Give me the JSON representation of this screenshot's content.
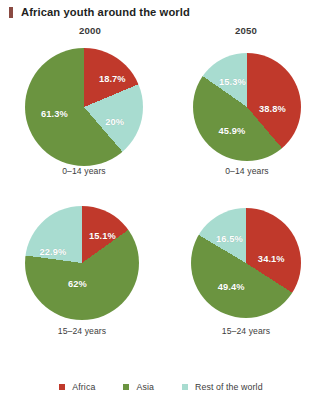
{
  "title": "African youth around the world",
  "title_marker_color": "#8a4a42",
  "columns": [
    {
      "year": "2000"
    },
    {
      "year": "2050"
    }
  ],
  "legend": {
    "position": "bottom-center",
    "items": [
      {
        "label": "Africa",
        "color": "#c0392b"
      },
      {
        "label": "Asia",
        "color": "#6b9440"
      },
      {
        "label": "Rest of the world",
        "color": "#a8dcd0"
      }
    ]
  },
  "chart_data": {
    "type": "pie",
    "title": "African youth around the world",
    "xlabel": "",
    "ylabel": "",
    "units": "percent",
    "legend": [
      "Africa",
      "Asia",
      "Rest of the world"
    ],
    "colors": {
      "Africa": "#c0392b",
      "Asia": "#6b9440",
      "Rest of the world": "#a8dcd0"
    },
    "panels": [
      {
        "year": "2000",
        "age_group": "0-14 years",
        "sub_label": "0–14 years",
        "categories": [
          "Africa",
          "Rest of the world",
          "Asia"
        ],
        "values": [
          18.7,
          20.0,
          61.3
        ],
        "labels": [
          "18.7%",
          "20%",
          "61.3%"
        ],
        "label_positions": [
          [
            0.48,
            -0.48
          ],
          [
            0.52,
            0.26
          ],
          [
            -0.5,
            0.12
          ]
        ]
      },
      {
        "year": "2050",
        "age_group": "0-14 years",
        "sub_label": "0–14 years",
        "categories": [
          "Africa",
          "Asia",
          "Rest of the world"
        ],
        "values": [
          38.8,
          45.9,
          15.3
        ],
        "labels": [
          "38.8%",
          "45.9%",
          "15.3%"
        ],
        "label_positions": [
          [
            0.47,
            0.04
          ],
          [
            -0.28,
            0.44
          ],
          [
            -0.27,
            -0.47
          ]
        ]
      },
      {
        "year": "2000",
        "age_group": "15-24 years",
        "sub_label": "15–24 years",
        "categories": [
          "Africa",
          "Asia",
          "Rest of the world"
        ],
        "values": [
          15.1,
          62.0,
          22.9
        ],
        "labels": [
          "15.1%",
          "62%",
          "22.9%"
        ],
        "label_positions": [
          [
            0.36,
            -0.47
          ],
          [
            -0.08,
            0.36
          ],
          [
            -0.51,
            -0.2
          ]
        ]
      },
      {
        "year": "2050",
        "age_group": "15-24 years",
        "sub_label": "15–24 years",
        "categories": [
          "Africa",
          "Asia",
          "Rest of the world"
        ],
        "values": [
          34.1,
          49.4,
          16.5
        ],
        "labels": [
          "34.1%",
          "49.4%",
          "16.5%"
        ],
        "label_positions": [
          [
            0.46,
            -0.08
          ],
          [
            -0.27,
            0.43
          ],
          [
            -0.3,
            -0.43
          ]
        ]
      }
    ]
  }
}
